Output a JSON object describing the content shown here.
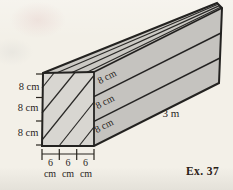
{
  "figure": {
    "caption": "Ex. 37",
    "length_label": "3 m",
    "height_segments": {
      "labels": [
        "8 cm",
        "8 cm",
        "8 cm"
      ]
    },
    "side_face_segments": {
      "labels": [
        "8 cm",
        "8 cm",
        "8 cm"
      ]
    },
    "width_segments": {
      "values": [
        "6",
        "6",
        "6"
      ],
      "units": [
        "cm",
        "cm",
        "cm"
      ]
    },
    "colors": {
      "paper": "#f3f0e8",
      "front_face": "#d8d6d1",
      "top_face": "#cbc9c4",
      "side_face": "#c5c3bf",
      "edge": "#232220",
      "text": "#29251e",
      "caption_text": "#2a2015"
    }
  }
}
